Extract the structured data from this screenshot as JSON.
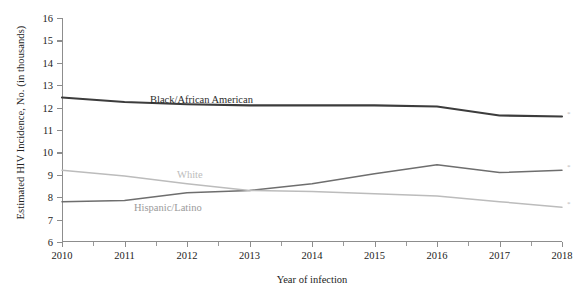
{
  "chart_data": {
    "type": "line",
    "title": "",
    "xlabel": "Year of infection",
    "ylabel": "Estimated HIV Incidence, No. (in thousands)",
    "x": [
      2010,
      2011,
      2012,
      2013,
      2014,
      2015,
      2016,
      2017,
      2018
    ],
    "xtick_labels": [
      "2010",
      "2011",
      "2012",
      "2013",
      "2014",
      "2015",
      "2016",
      "2017",
      "2018"
    ],
    "ytick_labels": [
      "16",
      "15",
      "14",
      "13",
      "12",
      "11",
      "10",
      "9",
      "8",
      "7",
      "6"
    ],
    "yticks": [
      16,
      15,
      14,
      13,
      12,
      11,
      10,
      9,
      8,
      7,
      6
    ],
    "xlim": [
      2010,
      2018
    ],
    "ylim": [
      6,
      16
    ],
    "grid": false,
    "legend_position": "inline-labels",
    "series": [
      {
        "name": "Black/African American",
        "color": "#3c3c3c",
        "width": 2.1,
        "values": [
          12.45,
          12.25,
          12.15,
          12.1,
          12.1,
          12.1,
          12.05,
          11.65,
          11.6
        ],
        "end_marker": "*"
      },
      {
        "name": "Hispanic/Latino",
        "color": "#6e6e6e",
        "width": 1.5,
        "values": [
          7.8,
          7.85,
          8.2,
          8.3,
          8.6,
          9.05,
          9.45,
          9.1,
          9.2
        ],
        "end_marker": "*"
      },
      {
        "name": "White",
        "color": "#bcbcbc",
        "width": 1.5,
        "values": [
          9.2,
          8.95,
          8.6,
          8.3,
          8.25,
          8.15,
          8.05,
          7.8,
          7.55
        ],
        "end_marker": "*"
      }
    ],
    "annotations": [
      {
        "name": "Black/African American",
        "text": "Black/African American",
        "color": "#2b2b2b",
        "left_px": 88,
        "top_px": 76
      },
      {
        "name": "White",
        "text": "White",
        "color": "#bcbcbc",
        "left_px": 115,
        "top_px": 151
      },
      {
        "name": "Hispanic/Latino",
        "text": "Hispanic/Latino",
        "color": "#9a9a9a",
        "left_px": 72,
        "top_px": 184
      }
    ]
  }
}
